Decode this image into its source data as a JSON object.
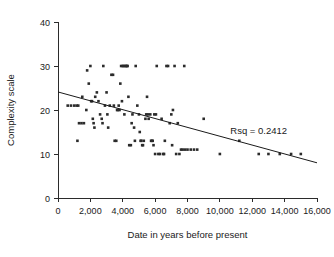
{
  "chart_data": {
    "type": "scatter",
    "title": "",
    "xlabel": "Date in years before present",
    "ylabel": "Complexity scale",
    "xlim": [
      0,
      16000
    ],
    "ylim": [
      0,
      40
    ],
    "grid": false,
    "legend": null,
    "xticks": [
      0,
      2000,
      4000,
      6000,
      8000,
      10000,
      12000,
      14000,
      16000
    ],
    "xtick_labels": [
      "0",
      "2,000",
      "4,000",
      "6,000",
      "8,000",
      "10,000",
      "12,000",
      "14,000",
      "16,000"
    ],
    "yticks": [
      0,
      10,
      20,
      30,
      40
    ],
    "ytick_labels": [
      "0",
      "10",
      "20",
      "30",
      "40"
    ],
    "annotations": [
      {
        "text": "Rsq = 0.2412",
        "x": 12400,
        "y": 14.5
      }
    ],
    "fit_line": {
      "x": [
        0,
        16000
      ],
      "y": [
        24.1,
        8.0
      ]
    },
    "points": [
      [
        600,
        21
      ],
      [
        800,
        21
      ],
      [
        1000,
        21
      ],
      [
        1150,
        21
      ],
      [
        1250,
        21
      ],
      [
        1200,
        13
      ],
      [
        1300,
        17
      ],
      [
        1450,
        17
      ],
      [
        1600,
        17
      ],
      [
        1500,
        23
      ],
      [
        1750,
        20
      ],
      [
        1800,
        29
      ],
      [
        1900,
        26
      ],
      [
        2000,
        30
      ],
      [
        2050,
        22
      ],
      [
        2100,
        22
      ],
      [
        2150,
        18
      ],
      [
        2200,
        17
      ],
      [
        2250,
        16
      ],
      [
        2300,
        23
      ],
      [
        2400,
        24
      ],
      [
        2500,
        22
      ],
      [
        2600,
        19
      ],
      [
        2700,
        18
      ],
      [
        2750,
        17
      ],
      [
        2800,
        30
      ],
      [
        2900,
        21
      ],
      [
        3000,
        24
      ],
      [
        3050,
        19
      ],
      [
        3100,
        16
      ],
      [
        3200,
        21
      ],
      [
        3300,
        28
      ],
      [
        3400,
        28
      ],
      [
        3450,
        21
      ],
      [
        3500,
        13
      ],
      [
        3600,
        13
      ],
      [
        3650,
        20
      ],
      [
        3700,
        20
      ],
      [
        3750,
        21
      ],
      [
        3800,
        20
      ],
      [
        3850,
        26
      ],
      [
        3900,
        30
      ],
      [
        3950,
        22
      ],
      [
        4000,
        30
      ],
      [
        4050,
        30
      ],
      [
        4100,
        19
      ],
      [
        4150,
        30
      ],
      [
        4200,
        30
      ],
      [
        4250,
        30
      ],
      [
        4300,
        30
      ],
      [
        4350,
        23
      ],
      [
        4400,
        12
      ],
      [
        4500,
        12
      ],
      [
        4550,
        17
      ],
      [
        4600,
        19
      ],
      [
        4700,
        16
      ],
      [
        4750,
        13
      ],
      [
        4800,
        30
      ],
      [
        4900,
        21
      ],
      [
        5000,
        19
      ],
      [
        5050,
        15
      ],
      [
        5100,
        13
      ],
      [
        5150,
        13
      ],
      [
        5200,
        12
      ],
      [
        5250,
        12
      ],
      [
        5300,
        13
      ],
      [
        5400,
        18
      ],
      [
        5450,
        19
      ],
      [
        5500,
        23
      ],
      [
        5550,
        19
      ],
      [
        5600,
        18
      ],
      [
        5700,
        19
      ],
      [
        5750,
        13
      ],
      [
        5800,
        13
      ],
      [
        5850,
        13
      ],
      [
        5900,
        12
      ],
      [
        5950,
        19
      ],
      [
        6000,
        10
      ],
      [
        6050,
        19
      ],
      [
        6100,
        30
      ],
      [
        6200,
        10
      ],
      [
        6300,
        10
      ],
      [
        6400,
        18
      ],
      [
        6500,
        10
      ],
      [
        6550,
        10
      ],
      [
        6600,
        13
      ],
      [
        6700,
        30
      ],
      [
        6800,
        30
      ],
      [
        6900,
        17
      ],
      [
        7000,
        19
      ],
      [
        7050,
        12
      ],
      [
        7100,
        20
      ],
      [
        7200,
        30
      ],
      [
        7300,
        10
      ],
      [
        7400,
        17
      ],
      [
        7500,
        10
      ],
      [
        7600,
        11
      ],
      [
        7700,
        11
      ],
      [
        7800,
        30
      ],
      [
        7850,
        11
      ],
      [
        8000,
        11
      ],
      [
        8200,
        11
      ],
      [
        8400,
        11
      ],
      [
        8600,
        11
      ],
      [
        9000,
        18
      ],
      [
        10000,
        10
      ],
      [
        11200,
        13
      ],
      [
        12400,
        10
      ],
      [
        13000,
        10
      ],
      [
        13700,
        10
      ],
      [
        14400,
        10
      ],
      [
        15000,
        10
      ]
    ]
  },
  "axes": {
    "x_axis_name": "x-axis",
    "y_axis_name": "y-axis"
  }
}
